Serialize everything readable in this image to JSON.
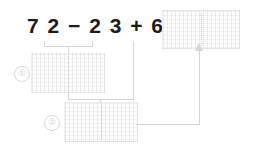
{
  "worksheet": {
    "expression": "7 2 − 2 3 + 6 =",
    "operands": [
      "72",
      "23",
      "6"
    ],
    "operators": [
      "−",
      "+"
    ],
    "equals_sign": "=",
    "steps": [
      {
        "marker": "①",
        "label": "①"
      },
      {
        "marker": "②",
        "label": "②"
      }
    ],
    "boxes": {
      "answer": "",
      "step1": "",
      "step2": ""
    },
    "colors": {
      "text": "#1b1b1b",
      "stroke": "#d5d5d5",
      "marker": "#cfcfcf",
      "grid": "#969696",
      "background": "#ffffff"
    }
  }
}
